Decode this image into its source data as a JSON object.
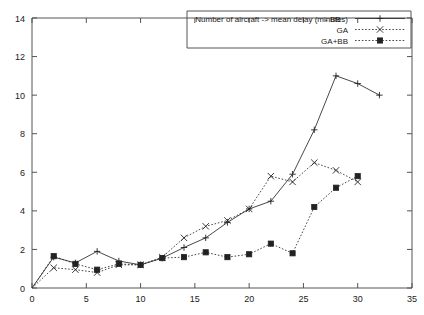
{
  "chart_data": {
    "type": "line",
    "title": "Number of aircraft -> mean delay (minutes)",
    "xlabel": "",
    "ylabel": "",
    "xlim": [
      0,
      35
    ],
    "ylim": [
      0,
      14
    ],
    "xticks": [
      0,
      5,
      10,
      15,
      20,
      25,
      30,
      35
    ],
    "yticks": [
      0,
      2,
      4,
      6,
      8,
      10,
      12,
      14
    ],
    "grid": false,
    "legend_position": "top-right",
    "legend_entries": [
      {
        "name": "BB",
        "line_style": "solid",
        "marker": "plus"
      },
      {
        "name": "GA",
        "line_style": "dotted",
        "marker": "cross"
      },
      {
        "name": "GA+BB",
        "line_style": "dotted",
        "marker": "filled-square"
      }
    ],
    "series": [
      {
        "name": "BB",
        "line_style": "solid",
        "marker": "plus",
        "points": [
          [
            0,
            0
          ],
          [
            2,
            1.6
          ],
          [
            4,
            1.3
          ],
          [
            6,
            1.9
          ],
          [
            8,
            1.4
          ],
          [
            10,
            1.2
          ],
          [
            12,
            1.55
          ],
          [
            14,
            2.1
          ],
          [
            16,
            2.6
          ],
          [
            18,
            3.4
          ],
          [
            20,
            4.1
          ],
          [
            22,
            4.5
          ],
          [
            24,
            5.9
          ],
          [
            26,
            8.2
          ],
          [
            28,
            11.0
          ],
          [
            30,
            10.6
          ],
          [
            32,
            10.0
          ]
        ]
      },
      {
        "name": "GA",
        "line_style": "dotted",
        "marker": "cross",
        "points": [
          [
            0,
            0
          ],
          [
            2,
            1.05
          ],
          [
            4,
            0.95
          ],
          [
            6,
            0.8
          ],
          [
            8,
            1.2
          ],
          [
            10,
            1.2
          ],
          [
            12,
            1.6
          ],
          [
            14,
            2.6
          ],
          [
            16,
            3.2
          ],
          [
            18,
            3.5
          ],
          [
            20,
            4.1
          ],
          [
            22,
            5.8
          ],
          [
            24,
            5.5
          ],
          [
            26,
            6.5
          ],
          [
            28,
            6.1
          ],
          [
            30,
            5.5
          ]
        ]
      },
      {
        "name": "GA+BB",
        "line_style": "dotted",
        "marker": "filled-square",
        "points": [
          [
            0,
            0
          ],
          [
            2,
            1.65
          ],
          [
            4,
            1.25
          ],
          [
            6,
            0.95
          ],
          [
            8,
            1.25
          ],
          [
            10,
            1.2
          ],
          [
            12,
            1.55
          ],
          [
            14,
            1.6
          ],
          [
            16,
            1.85
          ],
          [
            18,
            1.6
          ],
          [
            20,
            1.75
          ],
          [
            22,
            2.3
          ],
          [
            24,
            1.8
          ],
          [
            26,
            4.2
          ],
          [
            28,
            5.2
          ],
          [
            30,
            5.8
          ]
        ]
      }
    ]
  },
  "axes": {
    "x_tick_labels": [
      "0",
      "5",
      "10",
      "15",
      "20",
      "25",
      "30",
      "35"
    ],
    "y_tick_labels": [
      "0",
      "2",
      "4",
      "6",
      "8",
      "10",
      "12",
      "14"
    ]
  },
  "legend": {
    "title_text": "Number of aircraft -> mean delay (minutes)",
    "items": [
      {
        "label": "- BB"
      },
      {
        "label": "GA"
      },
      {
        "label": "GA+BB"
      }
    ]
  }
}
